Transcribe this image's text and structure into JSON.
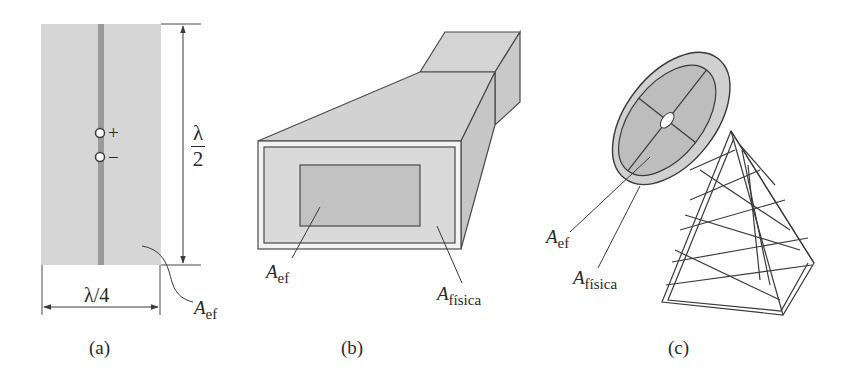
{
  "figure": {
    "panels": [
      {
        "id": "a",
        "caption": "(a)",
        "description": "Half-wave dipole with effective area rectangle",
        "labels": {
          "height_num": "λ",
          "height_den": "2",
          "width": "λ/4",
          "plus": "+",
          "minus": "−",
          "area_main": "A",
          "area_sub": "ef"
        }
      },
      {
        "id": "b",
        "caption": "(b)",
        "description": "Horn antenna with effective and physical aperture",
        "labels": {
          "eff_main": "A",
          "eff_sub": "ef",
          "phys_main": "A",
          "phys_sub": "física"
        }
      },
      {
        "id": "c",
        "caption": "(c)",
        "description": "Parabolic dish antenna on lattice tower",
        "labels": {
          "eff_main": "A",
          "eff_sub": "ef",
          "phys_main": "A",
          "phys_sub": "física"
        }
      }
    ],
    "colors": {
      "fill_light": "#d9d9d9",
      "fill_medium": "#c4c4c4",
      "fill_dark": "#a9a9a9",
      "stroke": "#4a4a4a",
      "text": "#2a2a2a"
    }
  }
}
